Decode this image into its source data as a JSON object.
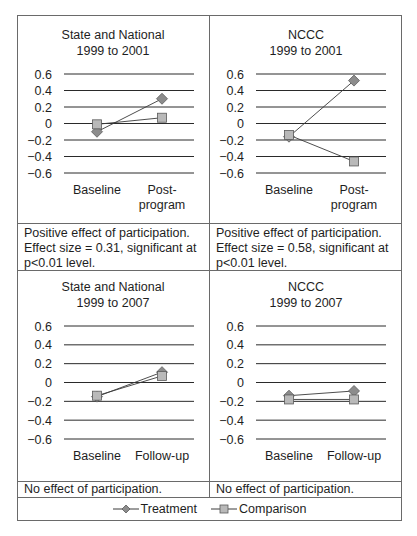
{
  "chart_data": [
    {
      "type": "line",
      "title": "State and National 1999 to 2001",
      "title_lines": [
        "State and National",
        "1999 to 2001"
      ],
      "categories": [
        "Baseline",
        "Post-program"
      ],
      "category_lines": [
        [
          "Baseline"
        ],
        [
          "Post-",
          "program"
        ]
      ],
      "series": [
        {
          "name": "Treatment",
          "values": [
            -0.1,
            0.3
          ]
        },
        {
          "name": "Comparison",
          "values": [
            -0.01,
            0.07
          ]
        }
      ],
      "ylim": [
        -0.6,
        0.6
      ],
      "yticks": [
        "0.6",
        "0.4",
        "0.2",
        "0",
        "−0.2",
        "−0.4",
        "−0.6"
      ],
      "grid": true,
      "note_lines": [
        "Positive effect of participation.",
        "Effect size = 0.31, significant at",
        "p<0.01 level."
      ]
    },
    {
      "type": "line",
      "title": "NCCC 1999 to 2001",
      "title_lines": [
        "NCCC",
        "1999 to 2001"
      ],
      "categories": [
        "Baseline",
        "Post-program"
      ],
      "category_lines": [
        [
          "Baseline"
        ],
        [
          "Post-",
          "program"
        ]
      ],
      "series": [
        {
          "name": "Treatment",
          "values": [
            -0.16,
            0.52
          ]
        },
        {
          "name": "Comparison",
          "values": [
            -0.14,
            -0.46
          ]
        }
      ],
      "ylim": [
        -0.6,
        0.6
      ],
      "yticks": [
        "0.6",
        "0.4",
        "0.2",
        "0",
        "−0.2",
        "−0.4",
        "−0.6"
      ],
      "grid": true,
      "note_lines": [
        "Positive effect of participation.",
        "Effect size = 0.58, significant at",
        "p<0.01 level."
      ]
    },
    {
      "type": "line",
      "title": "State and National 1999 to 2007",
      "title_lines": [
        "State and National",
        "1999 to 2007"
      ],
      "categories": [
        "Baseline",
        "Follow-up"
      ],
      "category_lines": [
        [
          "Baseline"
        ],
        [
          "Follow-up"
        ]
      ],
      "series": [
        {
          "name": "Treatment",
          "values": [
            -0.15,
            0.11
          ]
        },
        {
          "name": "Comparison",
          "values": [
            -0.14,
            0.07
          ]
        }
      ],
      "ylim": [
        -0.6,
        0.6
      ],
      "yticks": [
        "0.6",
        "0.4",
        "0.2",
        "0",
        "−0.2",
        "−0.4",
        "−0.6"
      ],
      "grid": true,
      "note_lines": [
        "No effect of participation."
      ]
    },
    {
      "type": "line",
      "title": "NCCC 1999 to 2007",
      "title_lines": [
        "NCCC",
        "1999 to 2007"
      ],
      "categories": [
        "Baseline",
        "Follow-up"
      ],
      "category_lines": [
        [
          "Baseline"
        ],
        [
          "Follow-up"
        ]
      ],
      "series": [
        {
          "name": "Treatment",
          "values": [
            -0.14,
            -0.09
          ]
        },
        {
          "name": "Comparison",
          "values": [
            -0.18,
            -0.18
          ]
        }
      ],
      "ylim": [
        -0.6,
        0.6
      ],
      "yticks": [
        "0.6",
        "0.4",
        "0.2",
        "0",
        "−0.2",
        "−0.4",
        "−0.6"
      ],
      "grid": true,
      "note_lines": [
        "No effect of participation."
      ]
    }
  ],
  "legend": {
    "position": "bottom",
    "items": [
      {
        "label": "Treatment",
        "marker": "diamond-icon"
      },
      {
        "label": "Comparison",
        "marker": "square-icon"
      }
    ]
  },
  "colors": {
    "frame": "#6a6a6a",
    "grid": "#2a2a2a",
    "series_line": "#3a3a3a",
    "treatment_marker": "#8c8c8c",
    "comparison_marker": "#b9b9b9",
    "marker_edge": "#5a5a5a"
  }
}
